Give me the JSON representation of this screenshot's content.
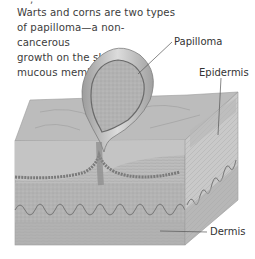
{
  "caption": {
    "lines": [
      "Warts and corns are two types",
      "of papilloma—a non-cancerous",
      "growth on the skin or a",
      "mucous membrane."
    ]
  },
  "labels": {
    "papilloma": "Papilloma",
    "epidermis": "Epidermis",
    "dermis": "Dermis"
  },
  "colors": {
    "background": "#ffffff",
    "text": "#3c3c3c",
    "tissue_light": "#d6d6d6",
    "tissue_mid": "#b4b4b4",
    "tissue_dark": "#8e8e8e",
    "leader_line": "#555555"
  }
}
